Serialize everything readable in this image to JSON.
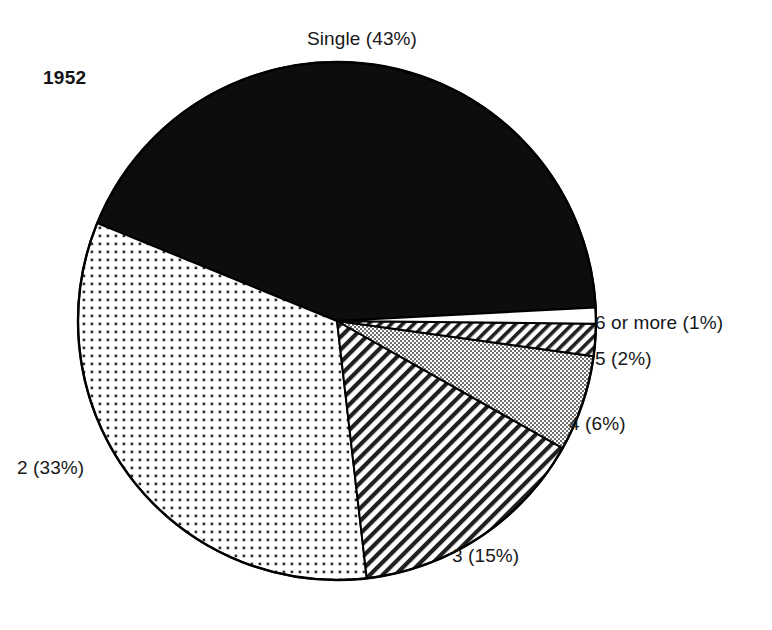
{
  "page": {
    "background_color": "#ffffff",
    "width": 772,
    "height": 630
  },
  "year_label": "1952",
  "chart_data": {
    "type": "pie",
    "title": "",
    "subtitle": "",
    "xlabel": "",
    "ylabel": "",
    "legend_position": "none",
    "grid": false,
    "annotations": [
      "1952"
    ],
    "center": {
      "x": 337,
      "y": 321
    },
    "radius": 259,
    "start_angle_deg": -3,
    "direction": "counterclockwise",
    "categories": [
      "Single",
      "2",
      "3",
      "4",
      "5",
      "6 or more"
    ],
    "values": [
      43,
      33,
      15,
      6,
      2,
      1
    ],
    "unit": "%",
    "labels": [
      "Single (43%)",
      "2 (33%)",
      "3 (15%)",
      "4 (6%)",
      "5 (2%)",
      "6 or more (1%)"
    ],
    "slices": [
      {
        "name": "single",
        "label": "Single (43%)",
        "value": 43,
        "fill_style": "solid-black",
        "fill_color": "#0d0d0d",
        "stroke_color": "#000000"
      },
      {
        "name": "two",
        "label": "2 (33%)",
        "value": 33,
        "fill_style": "dotted",
        "fill_color": "#ffffff",
        "pattern_color": "#2b2b2b",
        "stroke_color": "#000000"
      },
      {
        "name": "three",
        "label": "3 (15%)",
        "value": 15,
        "fill_style": "diagonal-hatch",
        "fill_color": "#ffffff",
        "pattern_color": "#1f1f1f",
        "stroke_color": "#000000"
      },
      {
        "name": "four",
        "label": "4 (6%)",
        "value": 6,
        "fill_style": "solid-gray",
        "fill_color": "#a6a6a6",
        "stroke_color": "#000000"
      },
      {
        "name": "five",
        "label": "5 (2%)",
        "value": 2,
        "fill_style": "diagonal-hatch",
        "fill_color": "#ffffff",
        "pattern_color": "#1f1f1f",
        "stroke_color": "#000000"
      },
      {
        "name": "six-or-more",
        "label": "6 or more (1%)",
        "value": 1,
        "fill_style": "none",
        "fill_color": "#ffffff",
        "stroke_color": "#000000"
      }
    ]
  },
  "colors": {
    "ink": "#18181a",
    "slice_black": "#0d0d0d",
    "slice_gray": "#a6a6a6",
    "slice_white": "#ffffff",
    "outline": "#000000",
    "background": "#ffffff"
  }
}
